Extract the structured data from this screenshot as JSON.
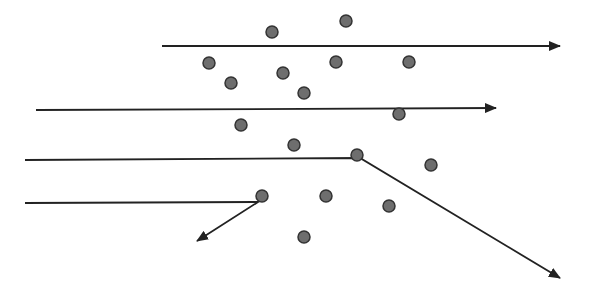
{
  "diagram": {
    "type": "particle-scattering",
    "colors": {
      "line": "#222222",
      "dot_fill": "#6e6e6e",
      "dot_stroke": "#333333",
      "background": "#ffffff"
    },
    "dot_radius": 6,
    "dots": [
      {
        "x": 272,
        "y": 32
      },
      {
        "x": 346,
        "y": 21
      },
      {
        "x": 209,
        "y": 63
      },
      {
        "x": 231,
        "y": 83
      },
      {
        "x": 283,
        "y": 73
      },
      {
        "x": 336,
        "y": 62
      },
      {
        "x": 409,
        "y": 62
      },
      {
        "x": 304,
        "y": 93
      },
      {
        "x": 241,
        "y": 125
      },
      {
        "x": 399,
        "y": 114
      },
      {
        "x": 294,
        "y": 145
      },
      {
        "x": 357,
        "y": 155
      },
      {
        "x": 431,
        "y": 165
      },
      {
        "x": 262,
        "y": 196
      },
      {
        "x": 326,
        "y": 196
      },
      {
        "x": 389,
        "y": 206
      },
      {
        "x": 304,
        "y": 237
      }
    ],
    "paths": [
      {
        "name": "trajectory-1-straight",
        "points": [
          [
            162,
            46
          ],
          [
            560,
            46
          ]
        ]
      },
      {
        "name": "trajectory-2-straight",
        "points": [
          [
            36,
            110
          ],
          [
            496,
            108
          ]
        ]
      },
      {
        "name": "trajectory-3-deflected",
        "points": [
          [
            25,
            160
          ],
          [
            360,
            158
          ],
          [
            560,
            278
          ]
        ]
      },
      {
        "name": "trajectory-4-backscattered",
        "points": [
          [
            25,
            203
          ],
          [
            258,
            202
          ],
          [
            197,
            241
          ]
        ]
      }
    ]
  }
}
